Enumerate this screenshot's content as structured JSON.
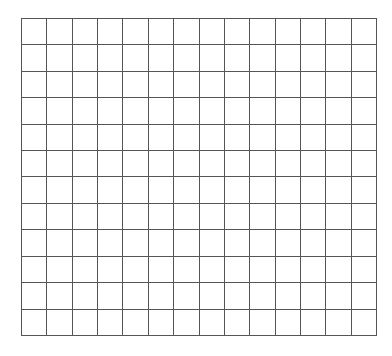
{
  "grid": {
    "columns": 14,
    "rows": 12,
    "line_color": "#555555",
    "background": "#ffffff"
  }
}
